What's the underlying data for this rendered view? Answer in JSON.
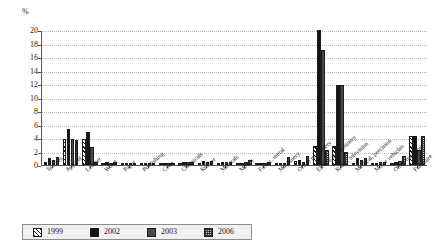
{
  "chart_data": {
    "type": "bar",
    "title": "",
    "subtitle": "",
    "xlabel": "",
    "ylabel": "%",
    "ylim": [
      0,
      20
    ],
    "ytick_step": 2,
    "yticks": [
      "20",
      "18",
      "16",
      "14",
      "12",
      "10",
      "8",
      "6",
      "4",
      "2",
      "0"
    ],
    "grid": true,
    "legend_position": "bottom",
    "categories": [
      "Textiles",
      "Apparel",
      "Leather",
      "Wood",
      "Paper",
      "Publishing",
      "Coke",
      "Chemicals",
      "Rubber",
      "Minerals",
      "Metals",
      "Fabric. metal",
      "Machinery",
      "Office machinery",
      "Electrical machinery",
      "Radio, television",
      "Medical, precision",
      "Motor vehicles",
      "Other transport",
      "Furniture"
    ],
    "series": [
      {
        "name": "1999",
        "color": "#ffffff",
        "pattern": "diagonal-hatch",
        "values": [
          0.5,
          3.9,
          3.9,
          0.2,
          0.1,
          0.1,
          0.0,
          0.2,
          0.2,
          0.1,
          0.1,
          0.1,
          0.2,
          0.6,
          2.8,
          2.8,
          0.3,
          0.1,
          0.2,
          4.3
        ]
      },
      {
        "name": "2002",
        "color": "#141414",
        "pattern": "solid-black",
        "values": [
          1.0,
          5.4,
          4.9,
          0.4,
          0.2,
          0.1,
          0.1,
          0.5,
          0.6,
          0.5,
          0.3,
          0.2,
          0.2,
          0.8,
          20.0,
          11.9,
          1.0,
          0.2,
          0.5,
          4.3
        ]
      },
      {
        "name": "2003",
        "color": "#4a4a4a",
        "pattern": "solid-gray",
        "values": [
          0.8,
          3.8,
          2.7,
          0.3,
          0.2,
          0.1,
          0.1,
          0.4,
          0.5,
          0.4,
          0.5,
          0.3,
          0.2,
          0.5,
          17.0,
          11.8,
          0.8,
          0.4,
          0.6,
          2.2
        ]
      },
      {
        "name": "2006",
        "color": "#cfcfcf",
        "pattern": "checker",
        "values": [
          1.2,
          3.7,
          0.4,
          0.4,
          0.2,
          0.1,
          0.1,
          0.5,
          0.6,
          0.5,
          0.8,
          0.4,
          1.2,
          1.4,
          2.2,
          2.0,
          1.0,
          0.4,
          1.4,
          4.3
        ]
      }
    ]
  },
  "legend": {
    "items": [
      {
        "label": "1999"
      },
      {
        "label": "2002"
      },
      {
        "label": "2003"
      },
      {
        "label": "2006"
      }
    ]
  }
}
